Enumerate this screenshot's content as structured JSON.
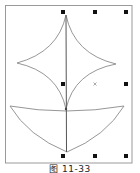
{
  "figure": {
    "caption": "图 11-33",
    "frame": {
      "x": 5,
      "y": 5,
      "width": 127,
      "height": 158,
      "stroke": "#9a9a9a"
    },
    "colors": {
      "line": "#8a8a8a",
      "axis": "#555555",
      "handle": "#111111",
      "center_marker": "#888888"
    },
    "shapes": [
      {
        "name": "four-point-star",
        "type": "concave-curved-star",
        "top": [
          66,
          15
        ],
        "left": [
          17,
          63
        ],
        "right": [
          116,
          64
        ],
        "bottom": [
          66,
          109
        ]
      },
      {
        "name": "bowl",
        "type": "curved-bowl",
        "left": [
          10,
          106
        ],
        "right": [
          124,
          106
        ],
        "bottom": [
          67,
          152
        ],
        "junction": [
          66,
          109
        ]
      },
      {
        "name": "vertical-axis",
        "type": "line",
        "from": [
          66,
          15
        ],
        "to": [
          66,
          152
        ]
      }
    ],
    "selection_handles": [
      {
        "position": "top-left",
        "x": 63,
        "y": 12
      },
      {
        "position": "top-center",
        "x": 95,
        "y": 12
      },
      {
        "position": "top-right",
        "x": 126,
        "y": 12
      },
      {
        "position": "middle-left",
        "x": 63,
        "y": 84
      },
      {
        "position": "middle-right",
        "x": 126,
        "y": 84
      },
      {
        "position": "bottom-left",
        "x": 63,
        "y": 156
      },
      {
        "position": "bottom-center",
        "x": 95,
        "y": 156
      },
      {
        "position": "bottom-right",
        "x": 126,
        "y": 156
      }
    ],
    "center_marker": {
      "x": 95,
      "y": 84
    }
  }
}
